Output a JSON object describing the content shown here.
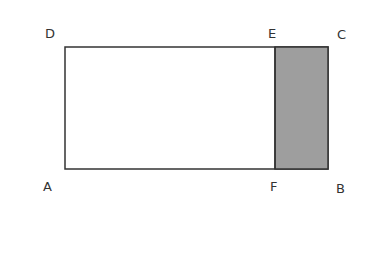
{
  "diagram": {
    "labels": {
      "A": "A",
      "B": "B",
      "C": "C",
      "D": "D",
      "E": "E",
      "F": "F"
    },
    "colors": {
      "stroke": "#333333",
      "shaded_fill": "#9e9e9e",
      "background": "#ffffff"
    }
  }
}
